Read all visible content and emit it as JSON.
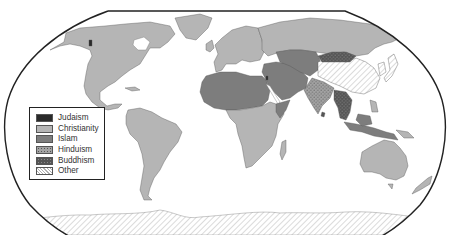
{
  "map": {
    "title": "World religions",
    "projection": "Robinson",
    "background": "#ffffff",
    "ocean": "#ffffff",
    "outline_color": "#222222"
  },
  "legend": {
    "items": [
      {
        "key": "judaism",
        "label": "Judaism",
        "color": "#2a2a2a",
        "pattern": "solid"
      },
      {
        "key": "christianity",
        "label": "Christianity",
        "color": "#b5b5b5",
        "pattern": "solid"
      },
      {
        "key": "islam",
        "label": "Islam",
        "color": "#7d7d7d",
        "pattern": "solid"
      },
      {
        "key": "hinduism",
        "label": "Hinduism",
        "color": "#9a9a9a",
        "pattern": "dots-light"
      },
      {
        "key": "buddhism",
        "label": "Buddhism",
        "color": "#555555",
        "pattern": "dots-dark"
      },
      {
        "key": "other",
        "label": "Other",
        "color": "#ffffff",
        "pattern": "hatch"
      }
    ]
  },
  "regions": [
    {
      "name": "North America",
      "religion": "christianity"
    },
    {
      "name": "Central America & Caribbean",
      "religion": "christianity"
    },
    {
      "name": "South America",
      "religion": "christianity"
    },
    {
      "name": "Greenland",
      "religion": "christianity"
    },
    {
      "name": "Europe",
      "religion": "christianity"
    },
    {
      "name": "Russia",
      "religion": "christianity"
    },
    {
      "name": "North Africa",
      "religion": "islam"
    },
    {
      "name": "Middle East",
      "religion": "islam"
    },
    {
      "name": "Central Asia",
      "religion": "islam"
    },
    {
      "name": "Israel",
      "religion": "judaism"
    },
    {
      "name": "Sub-Saharan Africa",
      "religion": "christianity"
    },
    {
      "name": "India",
      "religion": "hinduism"
    },
    {
      "name": "Nepal",
      "religion": "hinduism"
    },
    {
      "name": "Mongolia",
      "religion": "buddhism"
    },
    {
      "name": "Southeast Asia",
      "religion": "buddhism"
    },
    {
      "name": "Indonesia & Malaysia",
      "religion": "islam"
    },
    {
      "name": "Philippines",
      "religion": "christianity"
    },
    {
      "name": "China",
      "religion": "other"
    },
    {
      "name": "Japan & Korea",
      "religion": "other"
    },
    {
      "name": "Australia",
      "religion": "christianity"
    },
    {
      "name": "New Zealand",
      "religion": "christianity"
    },
    {
      "name": "Antarctica",
      "religion": "other"
    }
  ]
}
